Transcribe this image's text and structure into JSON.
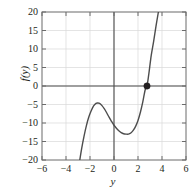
{
  "chart_data": {
    "type": "line",
    "title": "",
    "subtitle": "",
    "xlabel": "y",
    "ylabel": "f(y)",
    "xlim": [
      -6,
      6
    ],
    "ylim": [
      -20,
      20
    ],
    "xticks": [
      -6,
      -4,
      -2,
      0,
      2,
      4,
      6
    ],
    "xtick_labels": [
      "−6",
      "−4",
      "−2",
      "0",
      "2",
      "4",
      "6"
    ],
    "yticks": [
      -20,
      -15,
      -10,
      -5,
      0,
      5,
      10,
      15,
      20
    ],
    "ytick_labels": [
      "−20",
      "−15",
      "−10",
      "−5",
      "0",
      "5",
      "10",
      "15",
      "20"
    ],
    "grid": true,
    "grid_color": "#d9d9d9",
    "axis_color": "#4d4d4d",
    "curve_color": "#4d4d4d",
    "frame_color": "#6b6b6b",
    "legend": null,
    "series": [
      {
        "name": "f(y)",
        "color": "#4d4d4d",
        "x": [
          -2.85,
          -2.7,
          -2.5,
          -2.3,
          -2.1,
          -1.9,
          -1.7,
          -1.5,
          -1.35,
          -1.2,
          -1.0,
          -0.8,
          -0.6,
          -0.4,
          -0.2,
          0.0,
          0.2,
          0.4,
          0.6,
          0.8,
          1.0,
          1.2,
          1.4,
          1.6,
          1.8,
          2.0,
          2.2,
          2.4,
          2.6,
          2.75,
          2.9,
          3.1,
          3.3,
          3.5,
          3.7
        ],
        "y": [
          -20.0,
          -17.0,
          -13.6,
          -10.7,
          -8.4,
          -6.7,
          -5.4,
          -4.7,
          -4.6,
          -4.7,
          -5.3,
          -6.2,
          -7.3,
          -8.5,
          -9.6,
          -10.6,
          -11.4,
          -12.1,
          -12.6,
          -12.9,
          -13.0,
          -13.0,
          -12.7,
          -12.0,
          -10.9,
          -9.3,
          -7.1,
          -4.3,
          -1.0,
          0.0,
          3.2,
          8.2,
          12.0,
          16.2,
          20.0
        ]
      }
    ],
    "markers": [
      {
        "name": "root-marker",
        "x": 2.75,
        "y": 0,
        "color": "#231f20",
        "size": 3.2
      }
    ],
    "annotations": []
  }
}
